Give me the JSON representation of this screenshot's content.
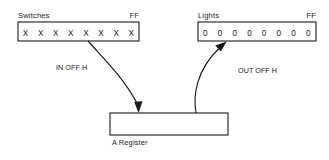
{
  "diagram": {
    "colors": {
      "stroke": "#1a1a1a",
      "background": "#ffffff",
      "fill": "#ffffff"
    },
    "switches": {
      "header_left": "Switches",
      "header_right": "FF",
      "cells": [
        "X",
        "X",
        "X",
        "X",
        "X",
        "X",
        "X",
        "X"
      ],
      "cell_count": 8
    },
    "lights": {
      "header_left": "Lights",
      "header_right": "FF",
      "cells": [
        "0",
        "0",
        "0",
        "0",
        "0",
        "0",
        "0",
        "0"
      ],
      "cell_count": 8
    },
    "register": {
      "label": "A Register"
    },
    "signals": {
      "input": "IN OFF H",
      "output": "OUT OFF H"
    }
  }
}
